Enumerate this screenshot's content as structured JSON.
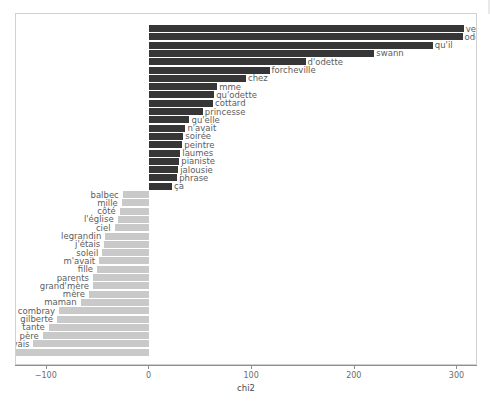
{
  "chart_data": {
    "type": "bar",
    "orientation": "horizontal",
    "title": "",
    "xlabel": "chi2",
    "ylabel": "",
    "xlim": [
      -130,
      320
    ],
    "xticks": [
      -100,
      0,
      100,
      200,
      300
    ],
    "xticklabels": [
      "−100",
      "0",
      "100",
      "200",
      "300"
    ],
    "grid": false,
    "legend": false,
    "colors": {
      "positive": "#363636",
      "negative": "#c9c9c9",
      "panel_border": "#d0d0d0",
      "axis": "#8e8e8e",
      "label_text": "#5d5d5d",
      "tick_text": "#6b6b6b"
    },
    "categories": [
      "verdurin",
      "odette",
      "qu'il",
      "swann",
      "d'odette",
      "forcheville",
      "chez",
      "mme",
      "qu'odette",
      "cottard",
      "princesse",
      "qu'elle",
      "n'avait",
      "soirée",
      "peintre",
      "laumes",
      "pianiste",
      "jalousie",
      "phrase",
      "ça",
      "balbec",
      "mille",
      "côté",
      "l'église",
      "ciel",
      "legrandin",
      "j'étais",
      "soleil",
      "m'avait",
      "fille",
      "parents",
      "grand'mère",
      "mère",
      "maman",
      "combray",
      "gilberte",
      "tante",
      "père",
      "j'avais",
      "françoise"
    ],
    "values": [
      306,
      305,
      276,
      219,
      152,
      117,
      94,
      66,
      63,
      62,
      52,
      39,
      35,
      33,
      32,
      30,
      29,
      28,
      27,
      22,
      -26,
      -27,
      -29,
      -31,
      -34,
      -43,
      -44,
      -46,
      -49,
      -51,
      -55,
      -55,
      -59,
      -67,
      -88,
      -90,
      -98,
      -104,
      -113,
      -147
    ]
  }
}
